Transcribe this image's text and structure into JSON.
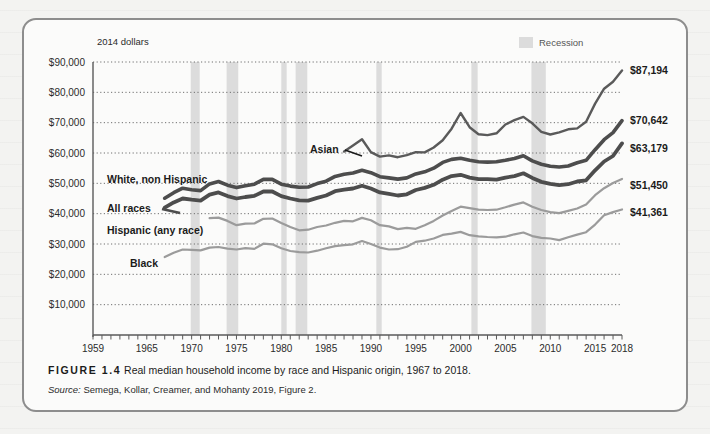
{
  "figure": {
    "number_label": "FIGURE 1.4",
    "caption": "Real median household income by race and Hispanic origin, 1967 to 2018.",
    "source_prefix": "Source:",
    "source_text": "Semega, Kollar, Creamer, and Mohanty 2019, Figure 2."
  },
  "legend": {
    "recession_label": "Recession",
    "recession_color": "#dcdcdc"
  },
  "chart_data": {
    "type": "line",
    "title": "Real median household income by race and Hispanic origin, 1967 to 2018",
    "units_note": "2014 dollars",
    "xlabel": "",
    "ylabel": "",
    "xlim": [
      1959,
      2018
    ],
    "ylim": [
      0,
      90000
    ],
    "grid": true,
    "legend_position": "inline-labels",
    "yticks": [
      "$10,000",
      "$20,000",
      "$30,000",
      "$40,000",
      "$50,000",
      "$60,000",
      "$70,000",
      "$80,000",
      "$90,000"
    ],
    "ytick_values": [
      10000,
      20000,
      30000,
      40000,
      50000,
      60000,
      70000,
      80000,
      90000
    ],
    "xticks": [
      "1959",
      "1965",
      "1970",
      "1975",
      "1980",
      "1985",
      "1990",
      "1995",
      "2000",
      "2005",
      "2010",
      "2015",
      "2018"
    ],
    "xtick_values": [
      1959,
      1965,
      1970,
      1975,
      1980,
      1985,
      1990,
      1995,
      2000,
      2005,
      2010,
      2015,
      2018
    ],
    "recession_bands": [
      [
        1969.9,
        1970.9
      ],
      [
        1973.9,
        1975.2
      ],
      [
        1980.0,
        1980.6
      ],
      [
        1981.6,
        1982.9
      ],
      [
        1990.6,
        1991.2
      ],
      [
        2001.2,
        2001.9
      ],
      [
        2007.9,
        2009.5
      ]
    ],
    "series": [
      {
        "name": "Asian",
        "label": "Asian",
        "color": "#5a5a5a",
        "width": 2.4,
        "end_label": "$87,194",
        "end_value": 87194,
        "x": [
          1987,
          1988,
          1989,
          1990,
          1991,
          1992,
          1993,
          1994,
          1995,
          1996,
          1997,
          1998,
          1999,
          2000,
          2001,
          2002,
          2003,
          2004,
          2005,
          2006,
          2007,
          2008,
          2009,
          2010,
          2011,
          2012,
          2013,
          2014,
          2015,
          2016,
          2017,
          2018
        ],
        "values": [
          60500,
          62500,
          64500,
          60300,
          58800,
          59200,
          58600,
          59300,
          60300,
          60200,
          61800,
          64200,
          68000,
          73200,
          68500,
          66200,
          65900,
          66500,
          69400,
          70800,
          71900,
          69800,
          67000,
          66100,
          66800,
          67800,
          68100,
          70300,
          76300,
          81200,
          83500,
          87194
        ]
      },
      {
        "name": "White, non Hispanic",
        "label": "White, non Hispanic",
        "color": "#4d4d4d",
        "width": 3.6,
        "end_label": "$70,642",
        "end_value": 70642,
        "x": [
          1967,
          1968,
          1969,
          1970,
          1971,
          1972,
          1973,
          1974,
          1975,
          1976,
          1977,
          1978,
          1979,
          1980,
          1981,
          1982,
          1983,
          1984,
          1985,
          1986,
          1987,
          1988,
          1989,
          1990,
          1991,
          1992,
          1993,
          1994,
          1995,
          1996,
          1997,
          1998,
          1999,
          2000,
          2001,
          2002,
          2003,
          2004,
          2005,
          2006,
          2007,
          2008,
          2009,
          2010,
          2011,
          2012,
          2013,
          2014,
          2015,
          2016,
          2017,
          2018
        ],
        "values": [
          45100,
          46900,
          48400,
          47900,
          47600,
          49800,
          50600,
          49400,
          48600,
          49200,
          49700,
          51300,
          51300,
          49700,
          49100,
          48700,
          48800,
          49900,
          50700,
          52300,
          53000,
          53400,
          54300,
          53500,
          52200,
          51800,
          51400,
          51800,
          53100,
          53800,
          55000,
          56900,
          57900,
          58300,
          57600,
          57100,
          57000,
          57100,
          57600,
          58200,
          59100,
          57400,
          56300,
          55600,
          55400,
          55700,
          56800,
          57600,
          61100,
          64400,
          66700,
          70642
        ]
      },
      {
        "name": "All races",
        "label": "All races",
        "color": "#4d4d4d",
        "width": 3.8,
        "end_label": "$63,179",
        "end_value": 63179,
        "x": [
          1967,
          1968,
          1969,
          1970,
          1971,
          1972,
          1973,
          1974,
          1975,
          1976,
          1977,
          1978,
          1979,
          1980,
          1981,
          1982,
          1983,
          1984,
          1985,
          1986,
          1987,
          1988,
          1989,
          1990,
          1991,
          1992,
          1993,
          1994,
          1995,
          1996,
          1997,
          1998,
          1999,
          2000,
          2001,
          2002,
          2003,
          2004,
          2005,
          2006,
          2007,
          2008,
          2009,
          2010,
          2011,
          2012,
          2013,
          2014,
          2015,
          2016,
          2017,
          2018
        ],
        "values": [
          42000,
          43700,
          45000,
          44600,
          44300,
          46300,
          47000,
          45800,
          45000,
          45500,
          45900,
          47300,
          47300,
          45800,
          45000,
          44400,
          44300,
          45200,
          46000,
          47400,
          47900,
          48300,
          49200,
          48300,
          47000,
          46500,
          46000,
          46400,
          47800,
          48500,
          49500,
          51200,
          52400,
          52800,
          51900,
          51400,
          51400,
          51200,
          51900,
          52400,
          53300,
          51800,
          50500,
          49800,
          49400,
          49700,
          50600,
          51000,
          54300,
          57200,
          59000,
          63179
        ]
      },
      {
        "name": "Hispanic (any race)",
        "label": "Hispanic (any race)",
        "color": "#9b9b9b",
        "width": 2.2,
        "end_label": "$51,450",
        "end_value": 51450,
        "x": [
          1972,
          1973,
          1974,
          1975,
          1976,
          1977,
          1978,
          1979,
          1980,
          1981,
          1982,
          1983,
          1984,
          1985,
          1986,
          1987,
          1988,
          1989,
          1990,
          1991,
          1992,
          1993,
          1994,
          1995,
          1996,
          1997,
          1998,
          1999,
          2000,
          2001,
          2002,
          2003,
          2004,
          2005,
          2006,
          2007,
          2008,
          2009,
          2010,
          2011,
          2012,
          2013,
          2014,
          2015,
          2016,
          2017,
          2018
        ],
        "values": [
          38500,
          38700,
          37600,
          36200,
          36700,
          36800,
          38300,
          38400,
          36900,
          35600,
          34500,
          34700,
          35600,
          36100,
          37000,
          37600,
          37500,
          38600,
          37800,
          36200,
          35800,
          34900,
          35300,
          35000,
          36200,
          37600,
          39400,
          40900,
          42300,
          41800,
          41300,
          41200,
          41300,
          42100,
          43000,
          43700,
          42300,
          41200,
          40500,
          40200,
          40900,
          41700,
          43000,
          46100,
          48400,
          50100,
          51450
        ]
      },
      {
        "name": "Black",
        "label": "Black",
        "color": "#9b9b9b",
        "width": 2.2,
        "end_label": "$41,361",
        "end_value": 41361,
        "x": [
          1967,
          1968,
          1969,
          1970,
          1971,
          1972,
          1973,
          1974,
          1975,
          1976,
          1977,
          1978,
          1979,
          1980,
          1981,
          1982,
          1983,
          1984,
          1985,
          1986,
          1987,
          1988,
          1989,
          1990,
          1991,
          1992,
          1993,
          1994,
          1995,
          1996,
          1997,
          1998,
          1999,
          2000,
          2001,
          2002,
          2003,
          2004,
          2005,
          2006,
          2007,
          2008,
          2009,
          2010,
          2011,
          2012,
          2013,
          2014,
          2015,
          2016,
          2017,
          2018
        ],
        "values": [
          25700,
          27100,
          28200,
          28100,
          27900,
          28800,
          29000,
          28500,
          28200,
          28600,
          28400,
          30100,
          29900,
          28600,
          27700,
          27300,
          27200,
          27800,
          28600,
          29300,
          29600,
          29900,
          31000,
          30000,
          28800,
          28200,
          28300,
          29100,
          30700,
          31100,
          31800,
          33000,
          33400,
          34000,
          32900,
          32500,
          32300,
          32200,
          32400,
          33200,
          33800,
          32600,
          32000,
          31800,
          31300,
          32200,
          33100,
          33900,
          36400,
          39500,
          40500,
          41361
        ]
      }
    ]
  }
}
